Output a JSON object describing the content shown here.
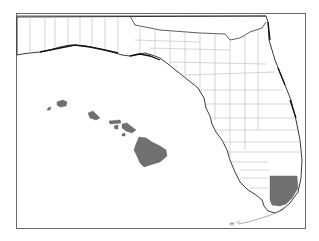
{
  "map": {
    "region": "Florida with Hawaii inset",
    "highlight_color": "#707070",
    "county_line_color": "#b9b9b9",
    "frame_color": "#6a6a6a",
    "highlighted_regions": [
      "Miami-Dade County (Florida)",
      "Hawaii (all islands)"
    ],
    "hawaii_islands": [
      "Niihau",
      "Kauai",
      "Oahu",
      "Molokai",
      "Lanai",
      "Maui",
      "Kahoolawe",
      "Hawaii (Big Island)"
    ]
  }
}
